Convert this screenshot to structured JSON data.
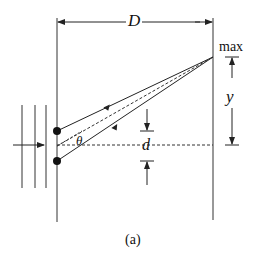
{
  "diagram": {
    "type": "double-slit interference geometry",
    "labels": {
      "distance": "D",
      "maximum": "max",
      "height": "y",
      "slit_separation": "d",
      "angle": "θ",
      "caption": "(a)"
    },
    "colors": {
      "line": "#222222",
      "background": "#ffffff"
    }
  }
}
